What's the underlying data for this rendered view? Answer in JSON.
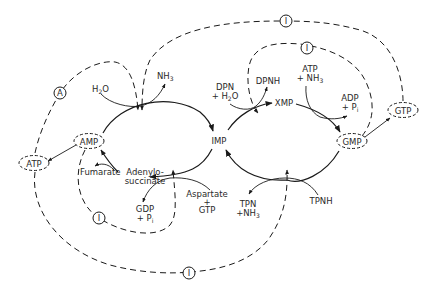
{
  "diagram": {
    "type": "metabolic-pathway",
    "center": {
      "label": "IMP"
    },
    "left_cycle": {
      "product": "AMP",
      "intermediate": {
        "line1": "Adenylo-",
        "line2": "succinate"
      },
      "inputs": [
        {
          "line1": "H",
          "sub": "2",
          "line1b": "O"
        },
        {
          "line1": "Aspartate",
          "line2": "+",
          "line3": "GTP"
        }
      ],
      "outputs": [
        {
          "line1": "NH",
          "sub": "3"
        },
        {
          "line1": "Fumarate"
        },
        {
          "line1": "GDP",
          "line2": "+ P",
          "sub2": "i"
        }
      ],
      "downstream": "ATP"
    },
    "right_cycle": {
      "product": "GMP",
      "intermediate": "XMP",
      "inputs": [
        {
          "line1": "DPN",
          "line2": "+ H",
          "sub2": "2",
          "line2b": "O"
        },
        {
          "line1": "ATP",
          "line2": "+ NH",
          "sub2": "3"
        },
        {
          "line1": "TPNH"
        }
      ],
      "outputs": [
        {
          "line1": "DPNH"
        },
        {
          "line1": "ADP",
          "line2": "+ P",
          "sub2": "i"
        },
        {
          "line1": "TPN",
          "line2": "+NH",
          "sub2": "3"
        }
      ],
      "downstream": "GTP"
    },
    "regulators": {
      "inhibitor_symbol": "I",
      "activator_symbol": "A",
      "items": [
        {
          "symbol": "I",
          "from": "GTP",
          "to": "AMP deaminase step"
        },
        {
          "symbol": "I",
          "from": "GMP",
          "to": "IMP dehydrogenase step"
        },
        {
          "symbol": "A",
          "from": "ATP",
          "to": "AMP deaminase step"
        },
        {
          "symbol": "I",
          "from": "AMP",
          "to": "adenylosuccinate synthetase step"
        },
        {
          "symbol": "I",
          "from": "ATP",
          "to": "GMP reductase step"
        }
      ]
    }
  }
}
